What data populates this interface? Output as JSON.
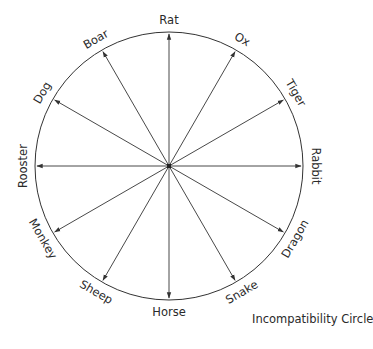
{
  "diagram": {
    "title": "Incompatibility Circle",
    "center": [
      169,
      166
    ],
    "radius": 134,
    "line_color": "#333333",
    "signs": [
      {
        "name": "Rat",
        "angle": 0
      },
      {
        "name": "Ox",
        "angle": 30
      },
      {
        "name": "Tiger",
        "angle": 60
      },
      {
        "name": "Rabbit",
        "angle": 90
      },
      {
        "name": "Dragon",
        "angle": 120
      },
      {
        "name": "Snake",
        "angle": 150
      },
      {
        "name": "Horse",
        "angle": 180
      },
      {
        "name": "Sheep",
        "angle": 210
      },
      {
        "name": "Monkey",
        "angle": 240
      },
      {
        "name": "Rooster",
        "angle": 270
      },
      {
        "name": "Dog",
        "angle": 300
      },
      {
        "name": "Boar",
        "angle": 330
      }
    ]
  }
}
